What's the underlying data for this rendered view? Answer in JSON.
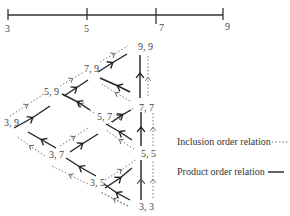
{
  "axis": {
    "ticks": [
      {
        "label": "3",
        "x": 8
      },
      {
        "label": "5",
        "x": 87
      },
      {
        "label": "7",
        "x": 156
      },
      {
        "label": "9",
        "x": 223
      }
    ]
  },
  "nodes": [
    {
      "id": "9,9",
      "label": "9, 9",
      "x": 138,
      "y": 42
    },
    {
      "id": "7,9",
      "label": "7, 9",
      "x": 84,
      "y": 65
    },
    {
      "id": "5,9",
      "label": "5, 9",
      "x": 44,
      "y": 88
    },
    {
      "id": "3,9",
      "label": "3, 9",
      "x": 4,
      "y": 118
    },
    {
      "id": "7,7",
      "label": "7, 7",
      "x": 138,
      "y": 104
    },
    {
      "id": "5,7",
      "label": "5, 7",
      "x": 97,
      "y": 112
    },
    {
      "id": "3,7",
      "label": "3, 7",
      "x": 49,
      "y": 150
    },
    {
      "id": "5,5",
      "label": "5, 5",
      "x": 140,
      "y": 149
    },
    {
      "id": "3,5",
      "label": "3, 5",
      "x": 90,
      "y": 178
    },
    {
      "id": "3,3",
      "label": "3, 3",
      "x": 139,
      "y": 202
    }
  ],
  "legend": {
    "inclusion": {
      "label": "Inclusion order relation",
      "style": "dotted"
    },
    "product": {
      "label": "Product order relation",
      "style": "solid"
    }
  }
}
